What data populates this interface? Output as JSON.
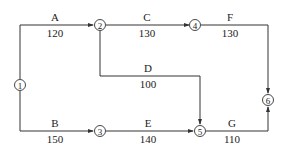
{
  "diagram": {
    "type": "activity-on-arrow network",
    "nodes": [
      {
        "id": "1",
        "label": "①"
      },
      {
        "id": "2",
        "label": "②"
      },
      {
        "id": "3",
        "label": "③"
      },
      {
        "id": "4",
        "label": "④"
      },
      {
        "id": "5",
        "label": "⑤"
      },
      {
        "id": "6",
        "label": "⑥"
      }
    ],
    "activities": [
      {
        "name": "A",
        "duration": "120",
        "from": "1",
        "to": "2"
      },
      {
        "name": "B",
        "duration": "150",
        "from": "1",
        "to": "3"
      },
      {
        "name": "C",
        "duration": "130",
        "from": "2",
        "to": "4"
      },
      {
        "name": "D",
        "duration": "100",
        "from": "2",
        "to": "5"
      },
      {
        "name": "E",
        "duration": "140",
        "from": "3",
        "to": "5"
      },
      {
        "name": "F",
        "duration": "130",
        "from": "4",
        "to": "6"
      },
      {
        "name": "G",
        "duration": "110",
        "from": "5",
        "to": "6"
      }
    ]
  }
}
